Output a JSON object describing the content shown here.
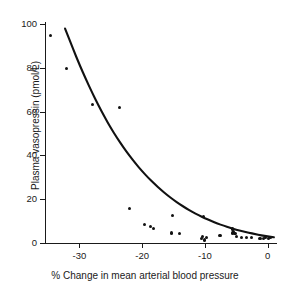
{
  "chart_data": {
    "type": "scatter",
    "title": "",
    "xlabel": "% Change in mean arterial blood pressure",
    "ylabel": "Plasma vasopressin (pmol/L)",
    "xlim": [
      -35.5,
      1.5
    ],
    "ylim": [
      0,
      101
    ],
    "xticks": [
      -30,
      -20,
      -10,
      0
    ],
    "xtick_labels": [
      "-30",
      "-20",
      "-10",
      "0"
    ],
    "yticks": [
      0,
      20,
      40,
      60,
      80,
      100
    ],
    "ytick_labels": [
      "0",
      "20",
      "40",
      "60",
      "80",
      "100"
    ],
    "grid": false,
    "legend": null,
    "marker_color": "#111111",
    "curve_color": "#111111",
    "points": [
      {
        "x": -34.6,
        "y": 95.0
      },
      {
        "x": -32.1,
        "y": 79.8
      },
      {
        "x": -27.9,
        "y": 63.3
      },
      {
        "x": -23.6,
        "y": 62.0
      },
      {
        "x": -22.0,
        "y": 15.6
      },
      {
        "x": -19.6,
        "y": 8.6
      },
      {
        "x": -18.7,
        "y": 7.6
      },
      {
        "x": -18.2,
        "y": 6.6
      },
      {
        "x": -15.2,
        "y": 12.6
      },
      {
        "x": -15.3,
        "y": 4.6
      },
      {
        "x": -14.1,
        "y": 4.3
      },
      {
        "x": -10.2,
        "y": 12.0
      },
      {
        "x": -10.4,
        "y": 3.1
      },
      {
        "x": -10.5,
        "y": 1.9
      },
      {
        "x": -10.1,
        "y": 1.4
      },
      {
        "x": -9.8,
        "y": 2.6
      },
      {
        "x": -7.6,
        "y": 3.4
      },
      {
        "x": -5.6,
        "y": 6.4
      },
      {
        "x": -5.4,
        "y": 5.4
      },
      {
        "x": -5.6,
        "y": 4.6
      },
      {
        "x": -5.2,
        "y": 4.2
      },
      {
        "x": -5.0,
        "y": 3.0
      },
      {
        "x": -4.2,
        "y": 2.4
      },
      {
        "x": -3.3,
        "y": 2.6
      },
      {
        "x": -2.6,
        "y": 2.4
      },
      {
        "x": -1.2,
        "y": 1.9
      },
      {
        "x": -0.7,
        "y": 2.2
      },
      {
        "x": -0.3,
        "y": 2.4
      },
      {
        "x": 0.2,
        "y": 2.0
      },
      {
        "x": 0.5,
        "y": 2.6
      }
    ],
    "fit_curve": {
      "description": "exponential decay fit",
      "x_start": -32.3,
      "x_end": 1.0,
      "points": [
        {
          "x": -32.3,
          "y": 98.0
        },
        {
          "x": -31.0,
          "y": 88.5
        },
        {
          "x": -30.0,
          "y": 81.5
        },
        {
          "x": -29.0,
          "y": 75.0
        },
        {
          "x": -28.0,
          "y": 68.8
        },
        {
          "x": -27.0,
          "y": 63.0
        },
        {
          "x": -26.0,
          "y": 57.6
        },
        {
          "x": -25.0,
          "y": 52.6
        },
        {
          "x": -24.0,
          "y": 48.0
        },
        {
          "x": -23.0,
          "y": 43.7
        },
        {
          "x": -22.0,
          "y": 39.8
        },
        {
          "x": -21.0,
          "y": 36.1
        },
        {
          "x": -20.0,
          "y": 32.8
        },
        {
          "x": -19.0,
          "y": 29.7
        },
        {
          "x": -18.0,
          "y": 26.9
        },
        {
          "x": -17.0,
          "y": 24.3
        },
        {
          "x": -16.0,
          "y": 21.9
        },
        {
          "x": -15.0,
          "y": 19.7
        },
        {
          "x": -14.0,
          "y": 17.7
        },
        {
          "x": -13.0,
          "y": 15.9
        },
        {
          "x": -12.0,
          "y": 14.2
        },
        {
          "x": -11.0,
          "y": 12.7
        },
        {
          "x": -10.0,
          "y": 11.3
        },
        {
          "x": -9.0,
          "y": 10.1
        },
        {
          "x": -8.0,
          "y": 8.9
        },
        {
          "x": -7.0,
          "y": 7.9
        },
        {
          "x": -6.0,
          "y": 7.0
        },
        {
          "x": -5.0,
          "y": 6.1
        },
        {
          "x": -4.0,
          "y": 5.4
        },
        {
          "x": -3.0,
          "y": 4.7
        },
        {
          "x": -2.0,
          "y": 4.1
        },
        {
          "x": -1.0,
          "y": 3.5
        },
        {
          "x": 0.0,
          "y": 3.0
        },
        {
          "x": 1.0,
          "y": 2.6
        }
      ]
    }
  }
}
